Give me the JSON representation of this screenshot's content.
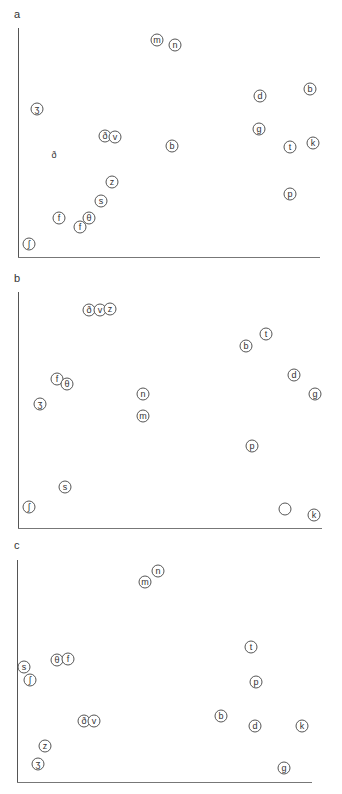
{
  "panels": [
    {
      "label": "a",
      "label_pos": [
        14,
        8
      ],
      "axis": {
        "left": 18,
        "top": 28,
        "bottom": 257,
        "right": 320
      },
      "points": [
        {
          "s": "m",
          "x": 157,
          "y": 40
        },
        {
          "s": "n",
          "x": 175,
          "y": 45
        },
        {
          "s": "ʒ",
          "x": 37,
          "y": 109
        },
        {
          "s": "ð",
          "x": 105,
          "y": 136
        },
        {
          "s": "v",
          "x": 115,
          "y": 137
        },
        {
          "s": "ð",
          "x": 54,
          "y": 156,
          "plain": true
        },
        {
          "s": "b",
          "x": 172,
          "y": 146
        },
        {
          "s": "d",
          "x": 260,
          "y": 96
        },
        {
          "s": "b",
          "x": 310,
          "y": 89
        },
        {
          "s": "g",
          "x": 259,
          "y": 129
        },
        {
          "s": "t",
          "x": 290,
          "y": 147
        },
        {
          "s": "k",
          "x": 313,
          "y": 143
        },
        {
          "s": "z",
          "x": 112,
          "y": 182
        },
        {
          "s": "s",
          "x": 101,
          "y": 201
        },
        {
          "s": "f",
          "x": 59,
          "y": 218
        },
        {
          "s": "θ",
          "x": 89,
          "y": 218
        },
        {
          "s": "f",
          "x": 80,
          "y": 227
        },
        {
          "s": "ʃ",
          "x": 29,
          "y": 244
        },
        {
          "s": "p",
          "x": 290,
          "y": 194
        }
      ]
    },
    {
      "label": "b",
      "label_pos": [
        14,
        272
      ],
      "axis": {
        "left": 18,
        "top": 292,
        "bottom": 528,
        "right": 322
      },
      "points": [
        {
          "s": "ð",
          "x": 89,
          "y": 310
        },
        {
          "s": "v",
          "x": 100,
          "y": 310
        },
        {
          "s": "z",
          "x": 110,
          "y": 309
        },
        {
          "s": "f",
          "x": 57,
          "y": 379
        },
        {
          "s": "θ",
          "x": 67,
          "y": 384
        },
        {
          "s": "ʒ",
          "x": 40,
          "y": 404
        },
        {
          "s": "n",
          "x": 143,
          "y": 394
        },
        {
          "s": "m",
          "x": 143,
          "y": 416
        },
        {
          "s": "s",
          "x": 65,
          "y": 487
        },
        {
          "s": "ʃ",
          "x": 29,
          "y": 507
        },
        {
          "s": "t",
          "x": 266,
          "y": 334
        },
        {
          "s": "b",
          "x": 246,
          "y": 346
        },
        {
          "s": "d",
          "x": 294,
          "y": 375
        },
        {
          "s": "g",
          "x": 315,
          "y": 394
        },
        {
          "s": "p",
          "x": 252,
          "y": 446
        },
        {
          "s": "",
          "x": 285,
          "y": 509
        },
        {
          "s": "k",
          "x": 314,
          "y": 515
        }
      ]
    },
    {
      "label": "c",
      "label_pos": [
        14,
        539
      ],
      "axis": {
        "left": 17,
        "top": 560,
        "bottom": 782,
        "right": 312
      },
      "points": [
        {
          "s": "n",
          "x": 158,
          "y": 571
        },
        {
          "s": "m",
          "x": 145,
          "y": 582
        },
        {
          "s": "θ",
          "x": 57,
          "y": 660
        },
        {
          "s": "f",
          "x": 68,
          "y": 659
        },
        {
          "s": "s",
          "x": 24,
          "y": 667
        },
        {
          "s": "ʃ",
          "x": 30,
          "y": 680
        },
        {
          "s": "ð",
          "x": 84,
          "y": 721
        },
        {
          "s": "v",
          "x": 94,
          "y": 721
        },
        {
          "s": "z",
          "x": 45,
          "y": 746
        },
        {
          "s": "ʒ",
          "x": 38,
          "y": 764
        },
        {
          "s": "t",
          "x": 251,
          "y": 647
        },
        {
          "s": "p",
          "x": 256,
          "y": 682
        },
        {
          "s": "b",
          "x": 221,
          "y": 716
        },
        {
          "s": "d",
          "x": 255,
          "y": 726
        },
        {
          "s": "k",
          "x": 302,
          "y": 726
        },
        {
          "s": "g",
          "x": 284,
          "y": 768
        }
      ]
    }
  ]
}
